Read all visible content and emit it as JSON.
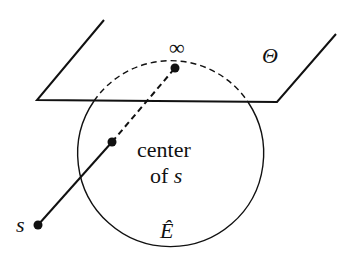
{
  "diagram": {
    "plane_label": "Θ",
    "infinity_label": "∞",
    "center_label_line1": "center",
    "center_label_line2_prefix": "of ",
    "center_label_line2_var": "s",
    "point_s_label": "s",
    "sphere_label": "Ê",
    "colors": {
      "stroke": "#111111",
      "background": "#ffffff"
    }
  }
}
